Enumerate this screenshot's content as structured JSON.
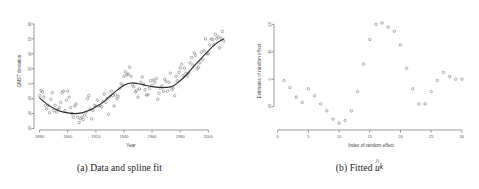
{
  "figure": {
    "panels": [
      {
        "id": "a",
        "caption_prefix": "(a)",
        "caption_text": "Data and spline fit"
      },
      {
        "id": "b",
        "caption_prefix": "(b)",
        "caption_text": "Fitted",
        "caption_symbol": "u",
        "caption_hat": "^",
        "caption_subscript": "k"
      }
    ]
  },
  "chart_data": [
    {
      "type": "scatter",
      "panel": "a",
      "title": "",
      "xlabel": "Year",
      "ylabel": "GMST deviation",
      "xlim": [
        1876,
        2014
      ],
      "ylim": [
        -62,
        96
      ],
      "xticks": [
        1880,
        1900,
        1920,
        1940,
        1960,
        1980,
        2000
      ],
      "yticks": [
        -60,
        -40,
        -20,
        0,
        20,
        40,
        60,
        80
      ],
      "grid": false,
      "legend": "none",
      "series": [
        {
          "name": "GMST deviation observations",
          "marker": "open-circle",
          "color": "#6f6f6f",
          "x": [
            1880,
            1881,
            1882,
            1883,
            1884,
            1885,
            1886,
            1887,
            1888,
            1889,
            1890,
            1891,
            1892,
            1893,
            1894,
            1895,
            1896,
            1897,
            1898,
            1899,
            1900,
            1901,
            1902,
            1903,
            1904,
            1905,
            1906,
            1907,
            1908,
            1909,
            1910,
            1911,
            1912,
            1913,
            1914,
            1915,
            1916,
            1917,
            1918,
            1919,
            1920,
            1921,
            1922,
            1923,
            1924,
            1925,
            1926,
            1927,
            1928,
            1929,
            1930,
            1931,
            1932,
            1933,
            1934,
            1935,
            1936,
            1937,
            1938,
            1939,
            1940,
            1941,
            1942,
            1943,
            1944,
            1945,
            1946,
            1947,
            1948,
            1949,
            1950,
            1951,
            1952,
            1953,
            1954,
            1955,
            1956,
            1957,
            1958,
            1959,
            1960,
            1961,
            1962,
            1963,
            1964,
            1965,
            1966,
            1967,
            1968,
            1969,
            1970,
            1971,
            1972,
            1973,
            1974,
            1975,
            1976,
            1977,
            1978,
            1979,
            1980,
            1981,
            1982,
            1983,
            1984,
            1985,
            1986,
            1987,
            1988,
            1989,
            1990,
            1991,
            1992,
            1993,
            1994,
            1995,
            1996,
            1997,
            1998,
            1999,
            2000,
            2001,
            2002,
            2003,
            2004,
            2005,
            2006,
            2007,
            2008,
            2009,
            2010,
            2011
          ],
          "y": [
            -16,
            -9,
            -11,
            -18,
            -29,
            -34,
            -29,
            -39,
            -21,
            -12,
            -36,
            -29,
            -38,
            -34,
            -32,
            -25,
            -12,
            -10,
            -36,
            -22,
            -10,
            -18,
            -32,
            -40,
            -45,
            -30,
            -27,
            -45,
            -52,
            -47,
            -45,
            -48,
            -42,
            -38,
            -20,
            -16,
            -34,
            -47,
            -36,
            -29,
            -30,
            -22,
            -30,
            -29,
            -31,
            -24,
            -14,
            -25,
            -20,
            -41,
            -17,
            -10,
            -16,
            -30,
            -15,
            -20,
            -17,
            -6,
            0,
            -2,
            10,
            16,
            12,
            13,
            22,
            10,
            -2,
            -4,
            -11,
            -9,
            -18,
            -7,
            2,
            9,
            -1,
            -8,
            -15,
            -15,
            -6,
            4,
            -2,
            5,
            2,
            7,
            -21,
            -13,
            -6,
            -3,
            -10,
            6,
            3,
            -10,
            2,
            14,
            -8,
            -6,
            -16,
            10,
            4,
            15,
            21,
            26,
            11,
            21,
            14,
            10,
            14,
            28,
            35,
            25,
            41,
            38,
            20,
            22,
            28,
            42,
            32,
            44,
            60,
            40,
            40,
            52,
            60,
            59,
            52,
            66,
            60,
            63,
            48,
            61,
            70,
            57
          ],
          "spline_fit": {
            "name": "Penalised spline fit",
            "color": "#2b2b2b",
            "x": [
              1880,
              1885,
              1890,
              1895,
              1900,
              1905,
              1910,
              1915,
              1920,
              1925,
              1930,
              1935,
              1940,
              1945,
              1950,
              1955,
              1960,
              1965,
              1970,
              1975,
              1980,
              1985,
              1990,
              1995,
              2000,
              2005,
              2011
            ],
            "y": [
              -19,
              -27,
              -33,
              -37,
              -39,
              -40,
              -39,
              -36,
              -31,
              -25,
              -17,
              -9,
              -2,
              1,
              0,
              -2,
              -4,
              -5,
              -5,
              -3,
              4,
              13,
              24,
              34,
              44,
              53,
              60
            ]
          }
        }
      ]
    },
    {
      "type": "scatter",
      "panel": "b",
      "title": "",
      "xlabel": "Index of random effect",
      "ylabel": "Estimates of random effect",
      "xlim": [
        -0.6,
        31
      ],
      "ylim": [
        -18.5,
        24.5
      ],
      "xticks": [
        0,
        5,
        10,
        15,
        20,
        25,
        30
      ],
      "yticks": [
        -10,
        0,
        10,
        20
      ],
      "grid": false,
      "legend": "none",
      "series": [
        {
          "name": "Fitted random effects",
          "marker": "open-circle",
          "color": "#6f6f6f",
          "x": [
            1,
            2,
            3,
            4,
            5,
            6,
            7,
            8,
            9,
            10,
            11,
            12,
            13,
            14,
            15,
            16,
            17,
            18,
            19,
            20,
            21,
            22,
            23,
            24,
            25,
            26,
            27,
            28,
            29,
            30
          ],
          "y": [
            -0.5,
            -3.0,
            -6.5,
            -8.5,
            -3.5,
            -6.0,
            -9.0,
            -11.5,
            -14.5,
            -16.0,
            -15.0,
            -11.5,
            -4.5,
            5.5,
            14.5,
            20.0,
            20.5,
            19.0,
            17.5,
            12.5,
            4.0,
            -3.5,
            -9.0,
            -9.0,
            -4.5,
            -0.5,
            2.5,
            1.0,
            0.0,
            0.0
          ]
        }
      ]
    }
  ]
}
